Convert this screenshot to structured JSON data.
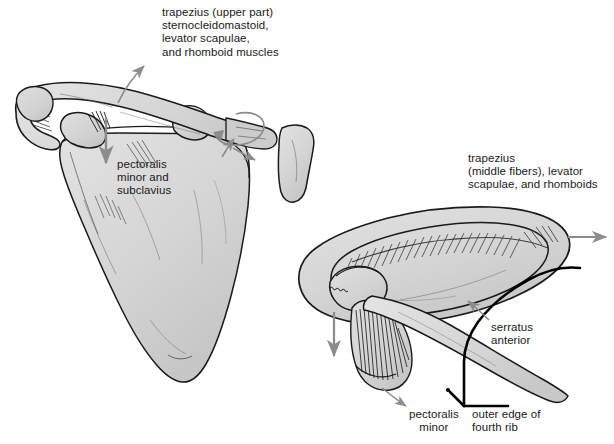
{
  "figure": {
    "background_color": "#ffffff",
    "bone_fill": "#d5d5d5",
    "bone_fill_light": "#e2e2e2",
    "bone_fill_dark": "#bdbdbd",
    "outline_color": "#1a1a1a",
    "arrow_color": "#8c8c8c",
    "text_color": "#1a1a1a",
    "thick_line_color": "#000000"
  },
  "labels": {
    "trapezius_upper": {
      "lines": [
        "trapezius (upper part)",
        "sternocleidomastoid,",
        "levator scapulae,",
        "and rhomboid muscles"
      ],
      "x": 162,
      "y": 6,
      "align": "left"
    },
    "pectoralis_minor_subclavius": {
      "lines": [
        "pectoralis",
        "minor and",
        "subclavius"
      ],
      "x": 117,
      "y": 158,
      "align": "left"
    },
    "trapezius_middle": {
      "lines": [
        "trapezius",
        "(middle fibers), levator",
        "scapulae, and rhomboids"
      ],
      "x": 468,
      "y": 152,
      "align": "left"
    },
    "serratus_anterior": {
      "lines": [
        "serratus",
        "anterior",
        ""
      ],
      "x": 491,
      "y": 321,
      "align": "left"
    },
    "pectoralis_minor": {
      "lines": [
        "pectoralis",
        "minor"
      ],
      "x": 409,
      "y": 408,
      "align": "left"
    },
    "outer_edge_fourth_rib": {
      "lines": [
        "outer edge of",
        "fourth rib"
      ],
      "x": 472,
      "y": 408,
      "align": "left"
    }
  },
  "annotations": {
    "arrows": [
      {
        "name": "trapezius-upper-arrow",
        "description": "curved arrow from scapular spine upward-left toward trapezius label"
      },
      {
        "name": "pectoralis-minor-down-arrow",
        "description": "downward arrow at coracoid process of left scapula"
      },
      {
        "name": "clavicle-rotation-arrow",
        "description": "circular rotation arrow around lateral clavicle"
      },
      {
        "name": "clavicle-elevation-arrow",
        "description": "small up arrow at acromioclavicular joint"
      },
      {
        "name": "trapezius-middle-arrow",
        "description": "horizontal right-pointing arrow at medial border of right scapula"
      },
      {
        "name": "serratus-anterior-arrow",
        "description": "arrow pointing up-left from serratus anterior label onto rib surface"
      },
      {
        "name": "right-scapula-down-arrow",
        "description": "downward arrow below right coracoid process"
      },
      {
        "name": "pectoralis-minor-arrow",
        "description": "arrow from pectoralis minor label up to muscle insertion"
      }
    ],
    "structures": [
      {
        "name": "left-scapula",
        "view": "anterior"
      },
      {
        "name": "left-clavicle",
        "view": "anterior"
      },
      {
        "name": "sternum-fragment",
        "view": "anterior"
      },
      {
        "name": "right-scapula",
        "view": "superior-oblique"
      },
      {
        "name": "right-clavicle",
        "view": "superior-oblique"
      },
      {
        "name": "fourth-rib-outline",
        "view": "superior-oblique"
      },
      {
        "name": "pectoralis-minor-muscle-fibers",
        "view": "superior-oblique"
      }
    ]
  }
}
